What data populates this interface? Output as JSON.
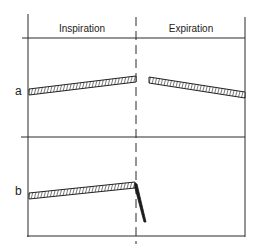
{
  "header": {
    "left_label": "Inspiration",
    "right_label": "Expiration"
  },
  "rows": [
    {
      "label": "a"
    },
    {
      "label": "b"
    }
  ],
  "colors": {
    "line": "#2a2a2a",
    "hatch_fill": "#ffffff",
    "background": "#ffffff"
  }
}
